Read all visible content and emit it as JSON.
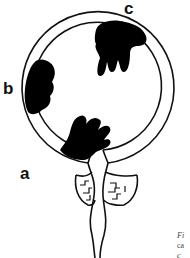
{
  "figure": {
    "type": "diagram",
    "labels": [
      {
        "id": "a",
        "text": "a"
      },
      {
        "id": "b",
        "text": "b"
      },
      {
        "id": "c",
        "text": "c"
      }
    ],
    "caption_fragment": {
      "line1": "Fi",
      "line2": "ca",
      "line3": "c"
    },
    "colors": {
      "stroke": "#111111",
      "fill_mass": "#000000",
      "background": "#ffffff"
    }
  }
}
